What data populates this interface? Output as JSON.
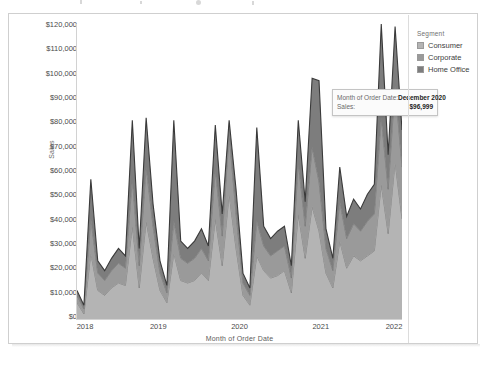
{
  "legend": {
    "title": "Segment",
    "items": [
      {
        "label": "Consumer",
        "color": "#b4b4b4"
      },
      {
        "label": "Corporate",
        "color": "#9a9a9a"
      },
      {
        "label": "Home Office",
        "color": "#7d7d7d"
      }
    ]
  },
  "tooltip": {
    "rows": [
      {
        "key": "Month of Order Date:",
        "value": "December 2020"
      },
      {
        "key": "Sales:",
        "value": "$96,999"
      }
    ]
  },
  "chart_data": {
    "type": "area",
    "stacked": true,
    "title": "",
    "xlabel": "Month of Order Date",
    "ylabel": "Sales",
    "ylim": [
      0,
      120000
    ],
    "ytick_labels": [
      "$120,000",
      "$110,000",
      "$100,000",
      "$90,000",
      "$80,000",
      "$70,000",
      "$60,000",
      "$50,000",
      "$40,000",
      "$30,000",
      "$20,000",
      "$10,000",
      "$0"
    ],
    "ytick_values": [
      120000,
      110000,
      100000,
      90000,
      80000,
      70000,
      60000,
      50000,
      40000,
      30000,
      20000,
      10000,
      0
    ],
    "xtick_labels": [
      "2018",
      "2019",
      "2020",
      "2021",
      "2022"
    ],
    "xtick_values": [
      2018,
      2019,
      2020,
      2021,
      2022
    ],
    "xlim": [
      2018,
      2022
    ],
    "grid": false,
    "legend_position": "right",
    "x": [
      "2018-01",
      "2018-02",
      "2018-03",
      "2018-04",
      "2018-05",
      "2018-06",
      "2018-07",
      "2018-08",
      "2018-09",
      "2018-10",
      "2018-11",
      "2018-12",
      "2019-01",
      "2019-02",
      "2019-03",
      "2019-04",
      "2019-05",
      "2019-06",
      "2019-07",
      "2019-08",
      "2019-09",
      "2019-10",
      "2019-11",
      "2019-12",
      "2020-01",
      "2020-02",
      "2020-03",
      "2020-04",
      "2020-05",
      "2020-06",
      "2020-07",
      "2020-08",
      "2020-09",
      "2020-10",
      "2020-11",
      "2020-12",
      "2021-01",
      "2021-02",
      "2021-03",
      "2021-04",
      "2021-05",
      "2021-06",
      "2021-07",
      "2021-08",
      "2021-09",
      "2021-10",
      "2021-11",
      "2021-12"
    ],
    "series": [
      {
        "name": "Consumer",
        "color": "#b4b4b4",
        "values": [
          7000,
          2500,
          27000,
          12000,
          10000,
          13000,
          15000,
          14000,
          38000,
          13000,
          40000,
          25000,
          12000,
          7000,
          27000,
          16000,
          15000,
          16000,
          19000,
          16000,
          41000,
          22000,
          51000,
          29000,
          10000,
          6000,
          26000,
          20000,
          17000,
          18000,
          20000,
          11000,
          43000,
          25000,
          46000,
          36000,
          19000,
          13000,
          32000,
          21000,
          26000,
          24000,
          26000,
          28000,
          55000,
          35000,
          64000,
          41000
        ]
      },
      {
        "name": "Corporate",
        "color": "#9a9a9a",
        "values": [
          3000,
          2000,
          14000,
          7000,
          6000,
          7000,
          8000,
          7000,
          19000,
          9000,
          22000,
          13000,
          7000,
          4000,
          13000,
          9000,
          8000,
          9000,
          10000,
          8000,
          20000,
          12000,
          24000,
          14000,
          5000,
          4000,
          14000,
          10000,
          9000,
          10000,
          10000,
          6000,
          21000,
          13000,
          24000,
          20000,
          10000,
          7000,
          16000,
          12000,
          13000,
          12000,
          14000,
          15000,
          27000,
          18000,
          31000,
          21000
        ]
      },
      {
        "name": "Home Office",
        "color": "#7d7d7d",
        "values": [
          2000,
          1500,
          16000,
          5000,
          4000,
          5000,
          6000,
          5000,
          24000,
          7000,
          20000,
          9000,
          5000,
          3000,
          41000,
          7000,
          6000,
          7000,
          8000,
          6000,
          18000,
          9000,
          6000,
          10000,
          4000,
          3000,
          38000,
          8000,
          7000,
          8000,
          8000,
          5000,
          17000,
          10000,
          28000,
          41000,
          8000,
          5000,
          14000,
          9000,
          10000,
          9000,
          11000,
          12000,
          38000,
          14000,
          24000,
          15000
        ]
      }
    ],
    "highlight_point": {
      "x": "2020-12",
      "label": "December 2020",
      "total": 96999
    }
  }
}
